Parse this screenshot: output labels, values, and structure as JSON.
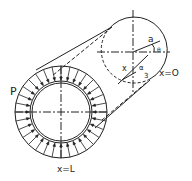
{
  "diagram": {
    "labels": {
      "pressure": "P",
      "end_far": "x=L",
      "end_near": "x=O",
      "radius": "a",
      "axial": "x",
      "angle": "θ",
      "alpha": "α",
      "alpha_sub": "3"
    },
    "colors": {
      "line": "#222222",
      "background": "#ffffff"
    }
  }
}
